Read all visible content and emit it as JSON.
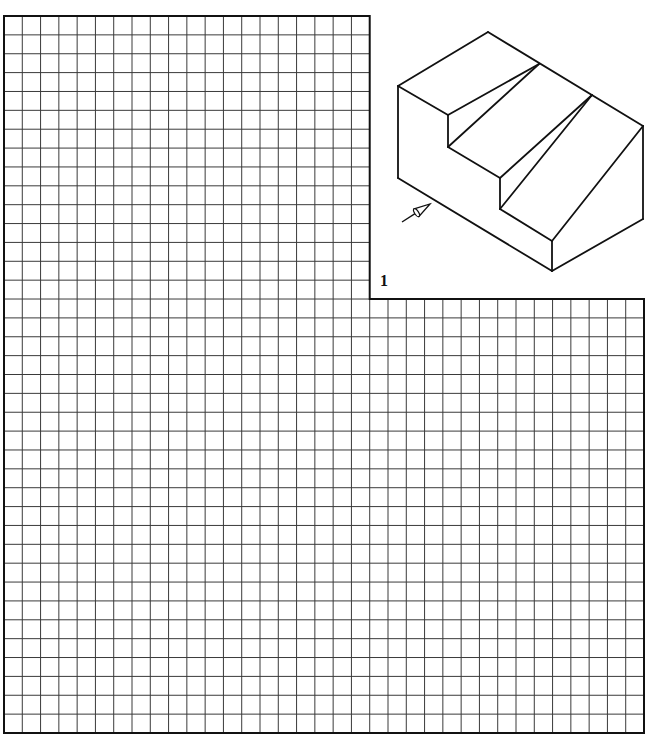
{
  "figure": {
    "label": "1"
  },
  "grid": {
    "columns_total": 35,
    "rows_total": 38,
    "notch_columns": 20,
    "notch_rows": 15,
    "left": 4,
    "top": 16,
    "right": 644,
    "bottom": 733,
    "notch_x": 368,
    "notch_y": 298,
    "line_color": "#3a3a3a",
    "border_color": "#111111"
  },
  "isometric": {
    "stroke_color": "#111111",
    "edges": [
      [
        488,
        32,
        398,
        86
      ],
      [
        488,
        32,
        643,
        126
      ],
      [
        398,
        86,
        398,
        178
      ],
      [
        398,
        86,
        448,
        115
      ],
      [
        448,
        115,
        539,
        64
      ],
      [
        539,
        64,
        448,
        147
      ],
      [
        448,
        115,
        448,
        147
      ],
      [
        448,
        147,
        500,
        178
      ],
      [
        500,
        178,
        592,
        95
      ],
      [
        592,
        95,
        500,
        209
      ],
      [
        500,
        178,
        500,
        209
      ],
      [
        500,
        209,
        552,
        241
      ],
      [
        552,
        241,
        643,
        126
      ],
      [
        552,
        241,
        552,
        271
      ],
      [
        398,
        178,
        552,
        271
      ],
      [
        552,
        271,
        643,
        219
      ],
      [
        643,
        126,
        643,
        219
      ]
    ],
    "view_arrow": {
      "tail": [
        402,
        222
      ],
      "tip": [
        430,
        204
      ]
    }
  }
}
